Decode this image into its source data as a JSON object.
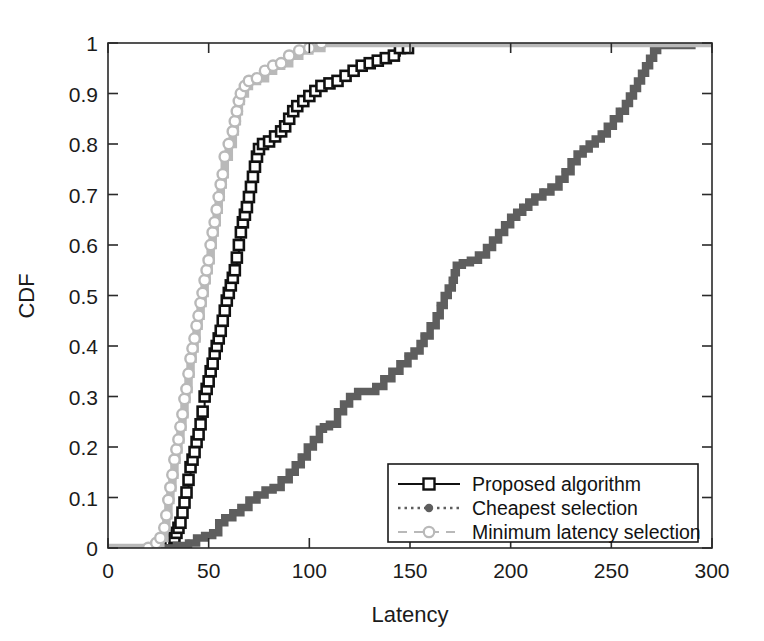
{
  "chart_data": {
    "type": "line",
    "title": "",
    "xlabel": "Latency",
    "ylabel": "CDF",
    "xlim": [
      0,
      300
    ],
    "ylim": [
      0,
      1
    ],
    "xticks": [
      0,
      50,
      100,
      150,
      200,
      250,
      300
    ],
    "xtick_labels": [
      "0",
      "50",
      "100",
      "150",
      "200",
      "250",
      "300"
    ],
    "yticks": [
      0,
      0.1,
      0.2,
      0.3,
      0.4,
      0.5,
      0.6,
      0.7,
      0.8,
      0.9,
      1
    ],
    "ytick_labels": [
      "0",
      "0.1",
      "0.2",
      "0.3",
      "0.4",
      "0.5",
      "0.6",
      "0.7",
      "0.8",
      "0.9",
      "1"
    ],
    "grid": false,
    "legend_position": "lower right",
    "series": [
      {
        "name": "Proposed algorithm",
        "color": "#111111",
        "line_style": "solid",
        "marker": "square",
        "points": [
          [
            26,
            0.005
          ],
          [
            29,
            0.01
          ],
          [
            31,
            0.015
          ],
          [
            33,
            0.02
          ],
          [
            34,
            0.03
          ],
          [
            35,
            0.04
          ],
          [
            36,
            0.05
          ],
          [
            37,
            0.07
          ],
          [
            38,
            0.09
          ],
          [
            39,
            0.11
          ],
          [
            40,
            0.135
          ],
          [
            41,
            0.16
          ],
          [
            42,
            0.175
          ],
          [
            43,
            0.19
          ],
          [
            44,
            0.21
          ],
          [
            45,
            0.225
          ],
          [
            46,
            0.245
          ],
          [
            47,
            0.27
          ],
          [
            48,
            0.3
          ],
          [
            49,
            0.315
          ],
          [
            50,
            0.33
          ],
          [
            51,
            0.35
          ],
          [
            52,
            0.365
          ],
          [
            53,
            0.385
          ],
          [
            54,
            0.4
          ],
          [
            55,
            0.415
          ],
          [
            56,
            0.43
          ],
          [
            57,
            0.45
          ],
          [
            58,
            0.47
          ],
          [
            59,
            0.49
          ],
          [
            60,
            0.505
          ],
          [
            61,
            0.52
          ],
          [
            62,
            0.535
          ],
          [
            63,
            0.55
          ],
          [
            64,
            0.575
          ],
          [
            65,
            0.6
          ],
          [
            66,
            0.625
          ],
          [
            67,
            0.645
          ],
          [
            68,
            0.66
          ],
          [
            69,
            0.675
          ],
          [
            70,
            0.695
          ],
          [
            71,
            0.715
          ],
          [
            72,
            0.735
          ],
          [
            73,
            0.755
          ],
          [
            74,
            0.775
          ],
          [
            75,
            0.79
          ],
          [
            77,
            0.8
          ],
          [
            80,
            0.805
          ],
          [
            83,
            0.815
          ],
          [
            86,
            0.825
          ],
          [
            88,
            0.835
          ],
          [
            90,
            0.85
          ],
          [
            92,
            0.865
          ],
          [
            94,
            0.875
          ],
          [
            97,
            0.885
          ],
          [
            100,
            0.895
          ],
          [
            103,
            0.905
          ],
          [
            106,
            0.915
          ],
          [
            110,
            0.92
          ],
          [
            114,
            0.925
          ],
          [
            118,
            0.935
          ],
          [
            122,
            0.945
          ],
          [
            126,
            0.955
          ],
          [
            130,
            0.96
          ],
          [
            134,
            0.965
          ],
          [
            138,
            0.97
          ],
          [
            142,
            0.975
          ],
          [
            145,
            0.99
          ],
          [
            149,
            0.99
          ]
        ]
      },
      {
        "name": "Cheapest selection",
        "color": "#5e5e5e",
        "line_style": "dashed",
        "marker": "dot",
        "points": [
          [
            0,
            0.0
          ],
          [
            28,
            0.0
          ],
          [
            34,
            0.005
          ],
          [
            40,
            0.01
          ],
          [
            44,
            0.02
          ],
          [
            48,
            0.025
          ],
          [
            52,
            0.03
          ],
          [
            55,
            0.05
          ],
          [
            58,
            0.06
          ],
          [
            62,
            0.07
          ],
          [
            66,
            0.08
          ],
          [
            70,
            0.095
          ],
          [
            74,
            0.105
          ],
          [
            78,
            0.115
          ],
          [
            82,
            0.12
          ],
          [
            86,
            0.135
          ],
          [
            90,
            0.15
          ],
          [
            93,
            0.165
          ],
          [
            96,
            0.18
          ],
          [
            99,
            0.2
          ],
          [
            102,
            0.215
          ],
          [
            105,
            0.235
          ],
          [
            107,
            0.24
          ],
          [
            110,
            0.245
          ],
          [
            114,
            0.27
          ],
          [
            117,
            0.285
          ],
          [
            120,
            0.3
          ],
          [
            124,
            0.31
          ],
          [
            129,
            0.31
          ],
          [
            133,
            0.32
          ],
          [
            137,
            0.335
          ],
          [
            141,
            0.35
          ],
          [
            145,
            0.365
          ],
          [
            149,
            0.38
          ],
          [
            152,
            0.39
          ],
          [
            155,
            0.405
          ],
          [
            157,
            0.42
          ],
          [
            160,
            0.44
          ],
          [
            163,
            0.46
          ],
          [
            165,
            0.48
          ],
          [
            167,
            0.5
          ],
          [
            169,
            0.515
          ],
          [
            171,
            0.53
          ],
          [
            172,
            0.545
          ],
          [
            173,
            0.56
          ],
          [
            176,
            0.565
          ],
          [
            180,
            0.57
          ],
          [
            184,
            0.58
          ],
          [
            188,
            0.595
          ],
          [
            191,
            0.61
          ],
          [
            194,
            0.625
          ],
          [
            197,
            0.64
          ],
          [
            200,
            0.655
          ],
          [
            203,
            0.665
          ],
          [
            206,
            0.675
          ],
          [
            209,
            0.685
          ],
          [
            212,
            0.695
          ],
          [
            216,
            0.705
          ],
          [
            220,
            0.715
          ],
          [
            224,
            0.73
          ],
          [
            227,
            0.745
          ],
          [
            230,
            0.765
          ],
          [
            233,
            0.78
          ],
          [
            236,
            0.79
          ],
          [
            239,
            0.8
          ],
          [
            242,
            0.81
          ],
          [
            245,
            0.82
          ],
          [
            248,
            0.835
          ],
          [
            251,
            0.85
          ],
          [
            254,
            0.865
          ],
          [
            257,
            0.88
          ],
          [
            259,
            0.895
          ],
          [
            261,
            0.91
          ],
          [
            263,
            0.925
          ],
          [
            265,
            0.94
          ],
          [
            267,
            0.955
          ],
          [
            269,
            0.97
          ],
          [
            271,
            0.985
          ],
          [
            273,
            0.995
          ],
          [
            290,
            1.0
          ]
        ]
      },
      {
        "name": "Minimum latency selection",
        "color": "#b9b9b9",
        "line_style": "dashed",
        "marker": "circle",
        "points": [
          [
            0,
            0.0
          ],
          [
            20,
            0.0
          ],
          [
            24,
            0.01
          ],
          [
            26,
            0.02
          ],
          [
            28,
            0.04
          ],
          [
            29,
            0.065
          ],
          [
            30,
            0.095
          ],
          [
            31,
            0.12
          ],
          [
            32,
            0.145
          ],
          [
            33,
            0.175
          ],
          [
            34,
            0.195
          ],
          [
            35,
            0.215
          ],
          [
            36,
            0.24
          ],
          [
            37,
            0.265
          ],
          [
            38,
            0.295
          ],
          [
            39,
            0.315
          ],
          [
            40,
            0.345
          ],
          [
            41,
            0.375
          ],
          [
            42,
            0.395
          ],
          [
            43,
            0.415
          ],
          [
            44,
            0.44
          ],
          [
            45,
            0.46
          ],
          [
            46,
            0.485
          ],
          [
            47,
            0.505
          ],
          [
            48,
            0.53
          ],
          [
            49,
            0.55
          ],
          [
            50,
            0.57
          ],
          [
            51,
            0.6
          ],
          [
            52,
            0.625
          ],
          [
            53,
            0.645
          ],
          [
            54,
            0.67
          ],
          [
            55,
            0.695
          ],
          [
            56,
            0.72
          ],
          [
            57,
            0.74
          ],
          [
            58,
            0.775
          ],
          [
            60,
            0.8
          ],
          [
            62,
            0.825
          ],
          [
            63,
            0.845
          ],
          [
            64,
            0.865
          ],
          [
            65,
            0.885
          ],
          [
            66,
            0.9
          ],
          [
            68,
            0.915
          ],
          [
            70,
            0.925
          ],
          [
            74,
            0.93
          ],
          [
            78,
            0.945
          ],
          [
            82,
            0.955
          ],
          [
            86,
            0.96
          ],
          [
            90,
            0.975
          ],
          [
            95,
            0.985
          ],
          [
            100,
            0.99
          ],
          [
            106,
            1.0
          ],
          [
            300,
            1.0
          ]
        ]
      }
    ]
  }
}
